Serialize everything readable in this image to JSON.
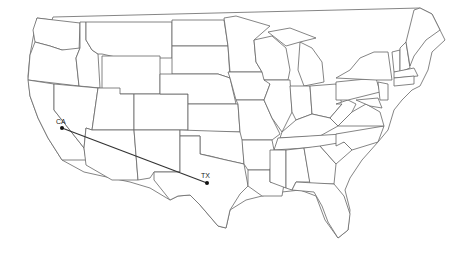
{
  "map": {
    "type": "us-states-outline",
    "background": "#ffffff",
    "stroke_color": "#666666",
    "route_color": "#333333",
    "route": {
      "from": {
        "label": "CA",
        "x": 62,
        "y": 128
      },
      "to": {
        "label": "TX",
        "x": 207,
        "y": 183
      }
    }
  }
}
